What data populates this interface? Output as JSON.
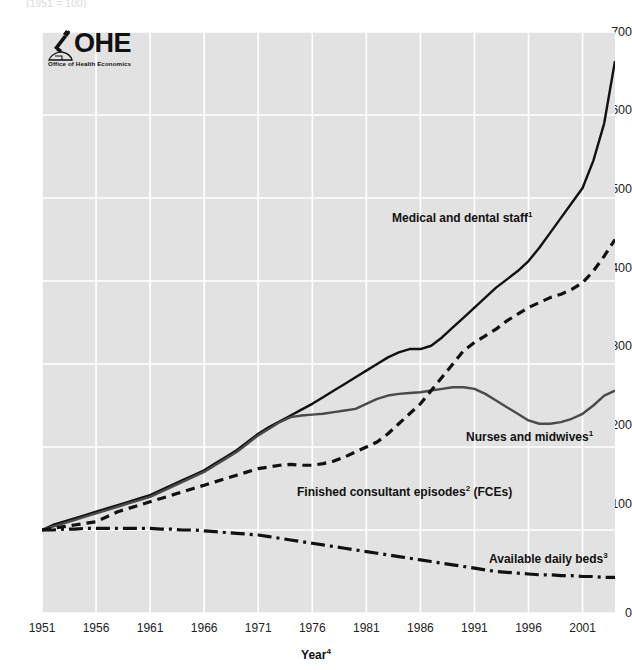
{
  "top_cut_text": "(1951 = 100)",
  "logo": {
    "wordmark": "OHE",
    "tagline": "Office of Health Economics",
    "icon": "microscope-icon"
  },
  "axis": {
    "x_title": "Year",
    "x_title_sup": "4",
    "y_ticks": [
      "700",
      "600",
      "500",
      "400",
      "300",
      "200",
      "100",
      "0"
    ],
    "x_ticks": [
      "1951",
      "1956",
      "1961",
      "1966",
      "1971",
      "1976",
      "1981",
      "1986",
      "1991",
      "1996",
      "2001"
    ]
  },
  "annotations": [
    {
      "name": "medical-and-dental-staff",
      "text": "Medical and dental  staff",
      "sup": "1"
    },
    {
      "name": "nurses-and-midwives",
      "text": "Nurses and midwives",
      "sup": "1"
    },
    {
      "name": "finished-consultant-episodes",
      "text": "Finished consultant episodes",
      "sup": "2",
      "suffix": " (FCEs)"
    },
    {
      "name": "available-daily-beds",
      "text": "Available daily beds",
      "sup": "3"
    }
  ],
  "colors": {
    "plot_background": "#e2e2e2",
    "gridline": "#ffffff",
    "medical": "#111111",
    "nurses": "#4a4a4a",
    "fces": "#111111",
    "beds": "#111111",
    "text": "#222222"
  },
  "chart_data": {
    "type": "line",
    "title": "",
    "subtitle": "(1951 = 100)",
    "xlabel": "Year",
    "ylabel": "",
    "xlim": [
      1951,
      2004
    ],
    "ylim": [
      0,
      700
    ],
    "ytick_step": 100,
    "xtick_step": 5,
    "grid": true,
    "legend": "inline-annotations",
    "x": [
      1951,
      1952,
      1953,
      1954,
      1955,
      1956,
      1957,
      1958,
      1959,
      1960,
      1961,
      1962,
      1963,
      1964,
      1965,
      1966,
      1967,
      1968,
      1969,
      1970,
      1971,
      1972,
      1973,
      1974,
      1975,
      1976,
      1977,
      1978,
      1979,
      1980,
      1981,
      1982,
      1983,
      1984,
      1985,
      1986,
      1987,
      1988,
      1989,
      1990,
      1991,
      1992,
      1993,
      1994,
      1995,
      1996,
      1997,
      1998,
      1999,
      2000,
      2001,
      2002,
      2003,
      2004
    ],
    "series": [
      {
        "name": "Medical and dental staff",
        "note": "1",
        "style": "solid",
        "color": "#111111",
        "values": [
          100,
          106,
          110,
          114,
          118,
          122,
          126,
          130,
          134,
          138,
          142,
          148,
          154,
          160,
          166,
          172,
          180,
          188,
          196,
          206,
          216,
          224,
          231,
          238,
          245,
          252,
          260,
          268,
          276,
          284,
          292,
          300,
          308,
          314,
          318,
          318,
          322,
          332,
          344,
          356,
          368,
          380,
          392,
          402,
          412,
          424,
          440,
          458,
          476,
          494,
          512,
          545,
          590,
          665
        ]
      },
      {
        "name": "Nurses and midwives",
        "note": "1",
        "style": "solid",
        "color": "#4a4a4a",
        "values": [
          100,
          104,
          108,
          112,
          116,
          120,
          124,
          128,
          132,
          136,
          140,
          146,
          152,
          158,
          164,
          170,
          178,
          186,
          194,
          204,
          214,
          222,
          230,
          236,
          238,
          239,
          240,
          242,
          244,
          246,
          252,
          258,
          262,
          264,
          265,
          266,
          268,
          270,
          272,
          272,
          270,
          264,
          256,
          248,
          240,
          232,
          228,
          228,
          230,
          234,
          240,
          250,
          262,
          268
        ]
      },
      {
        "name": "Finished consultant episodes (FCEs)",
        "note": "2",
        "style": "dashed",
        "color": "#111111",
        "values": [
          100,
          102,
          104,
          106,
          108,
          110,
          116,
          122,
          126,
          130,
          134,
          138,
          142,
          146,
          150,
          154,
          158,
          162,
          166,
          170,
          174,
          176,
          178,
          179,
          178,
          178,
          180,
          183,
          188,
          194,
          200,
          206,
          216,
          228,
          240,
          252,
          268,
          284,
          300,
          316,
          326,
          334,
          342,
          352,
          360,
          368,
          374,
          380,
          384,
          390,
          398,
          412,
          430,
          450
        ]
      },
      {
        "name": "Available daily beds",
        "note": "3",
        "style": "dash-dot",
        "color": "#111111",
        "values": [
          100,
          100,
          101,
          101,
          102,
          102,
          102,
          102,
          102,
          102,
          102,
          101,
          101,
          100,
          100,
          99,
          98,
          97,
          96,
          95,
          94,
          92,
          90,
          88,
          86,
          84,
          82,
          80,
          78,
          76,
          74,
          72,
          70,
          68,
          66,
          64,
          62,
          60,
          58,
          56,
          54,
          52,
          50,
          49,
          48,
          47,
          46,
          46,
          45,
          45,
          44,
          44,
          43,
          43
        ]
      }
    ]
  }
}
